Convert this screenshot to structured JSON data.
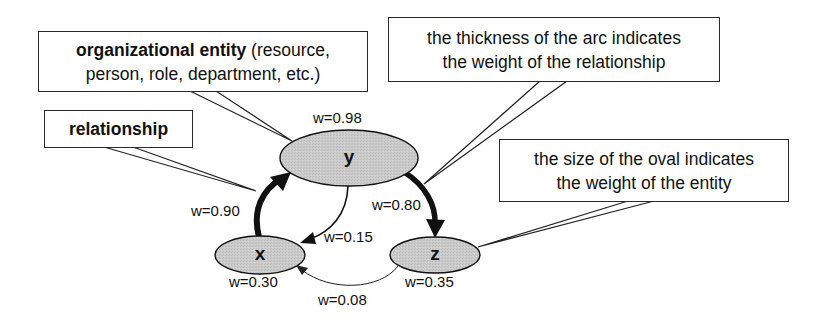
{
  "callouts": {
    "entity": {
      "bold": "organizational entity",
      "rest_line1": " (resource,",
      "line2": "person, role, department, etc.)"
    },
    "relationship": {
      "label": "relationship"
    },
    "arc_thickness": {
      "line1": "the thickness of the arc indicates",
      "line2": "the weight of the relationship"
    },
    "oval_size": {
      "line1": "the size of the oval indicates",
      "line2": "the weight of the entity"
    }
  },
  "nodes": [
    {
      "id": "y",
      "label": "y",
      "weight_label": "w=0.98"
    },
    {
      "id": "x",
      "label": "x",
      "weight_label": "w=0.30"
    },
    {
      "id": "z",
      "label": "z",
      "weight_label": "w=0.35"
    }
  ],
  "edges": [
    {
      "from": "x",
      "to": "y",
      "weight_label": "w=0.90"
    },
    {
      "from": "y",
      "to": "z",
      "weight_label": "w=0.80"
    },
    {
      "from": "y",
      "to": "x",
      "weight_label": "w=0.15"
    },
    {
      "from": "z",
      "to": "x",
      "weight_label": "w=0.08"
    }
  ],
  "colors": {
    "node_fill": "#c8c8c8",
    "stroke": "#111111"
  }
}
